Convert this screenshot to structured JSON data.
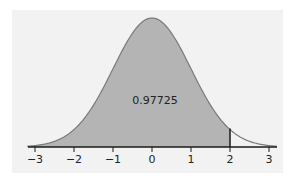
{
  "chart_data": {
    "type": "area",
    "title": "",
    "distribution": "standard normal",
    "xlabel": "",
    "ylabel": "",
    "xlim": [
      -3,
      3
    ],
    "x_ticks": [
      -3,
      -2,
      -1,
      0,
      1,
      2,
      3
    ],
    "x_tick_labels": [
      "−3",
      "−2",
      "−1",
      "0",
      "1",
      "2",
      "3"
    ],
    "shaded_region": {
      "from": "-inf",
      "to": 2
    },
    "cutoff_line_x": 2,
    "annotation": "0.97725",
    "grid": false,
    "legend": null
  },
  "colors": {
    "panel_bg": "#f2f2f2",
    "shade": "#b4b4b4",
    "curve": "#7a7a7a",
    "axis": "#1a1a1a"
  }
}
